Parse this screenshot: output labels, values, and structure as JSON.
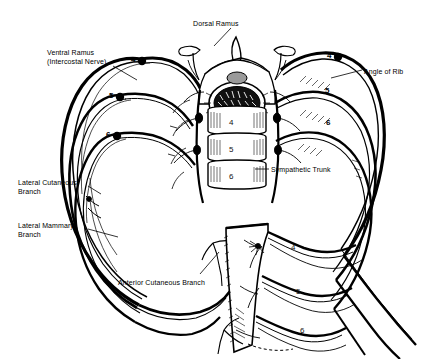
{
  "figure": {
    "background_color": "#ffffff",
    "ink_color": "#000000",
    "width": 424,
    "height": 359
  },
  "labels": [
    {
      "id": "dorsal-ramus",
      "text": "Dorsal Ramus",
      "x": 193,
      "y": 20,
      "align": "left"
    },
    {
      "id": "ventral-ramus",
      "text": "Ventral Ramus\n(Intercostal Nerve)",
      "x": 47,
      "y": 49,
      "align": "left"
    },
    {
      "id": "angle-of-rib",
      "text": "Angle of Rib",
      "x": 364,
      "y": 68,
      "align": "left"
    },
    {
      "id": "sympathetic-trunk",
      "text": "Sympathetic Trunk",
      "x": 271,
      "y": 166,
      "align": "left"
    },
    {
      "id": "lateral-cutaneous",
      "text": "Lateral Cutaneous\nBranch",
      "x": 18,
      "y": 179,
      "align": "left"
    },
    {
      "id": "lateral-mammary",
      "text": "Lateral Mammary\nBranch",
      "x": 18,
      "y": 222,
      "align": "left"
    },
    {
      "id": "anterior-cutaneous",
      "text": "Anterior Cutaneous Branch",
      "x": 118,
      "y": 279,
      "align": "left"
    }
  ],
  "vertebra_numbers": [
    {
      "id": "vertebra-4",
      "text": "4",
      "x": 229,
      "y": 118
    },
    {
      "id": "vertebra-5",
      "text": "5",
      "x": 229,
      "y": 145
    },
    {
      "id": "vertebra-6",
      "text": "6",
      "x": 229,
      "y": 172
    }
  ],
  "rib_numbers_left": [
    {
      "id": "rib-left-4",
      "text": "4",
      "x": 131,
      "y": 58,
      "ganglion": true
    },
    {
      "id": "rib-left-5",
      "text": "5",
      "x": 108,
      "y": 93,
      "ganglion": true
    },
    {
      "id": "rib-left-6",
      "text": "6",
      "x": 104,
      "y": 132,
      "ganglion": true
    }
  ],
  "rib_numbers_right": [
    {
      "id": "rib-right-4",
      "text": "4",
      "x": 327,
      "y": 54,
      "ganglion": true
    },
    {
      "id": "rib-right-5",
      "text": "5",
      "x": 325,
      "y": 88,
      "ganglion": false
    },
    {
      "id": "rib-right-6",
      "text": "6",
      "x": 326,
      "y": 120,
      "ganglion": false
    }
  ],
  "inset_rib_numbers": [
    {
      "id": "inset-rib-4",
      "text": "4",
      "x": 291,
      "y": 245
    },
    {
      "id": "inset-rib-5",
      "text": "5",
      "x": 296,
      "y": 289
    },
    {
      "id": "inset-rib-6",
      "text": "6",
      "x": 300,
      "y": 328
    }
  ],
  "structures": [
    {
      "id": "spinal-cord",
      "name": "spinal-cord"
    },
    {
      "id": "vertebral-body",
      "name": "vertebral-body-stack"
    },
    {
      "id": "spinous-process",
      "name": "spinous-process"
    },
    {
      "id": "rib-arcs-left",
      "name": "rib-arcs-left"
    },
    {
      "id": "rib-arcs-right",
      "name": "rib-arcs-right"
    },
    {
      "id": "sternum",
      "name": "sternum-inset"
    }
  ]
}
